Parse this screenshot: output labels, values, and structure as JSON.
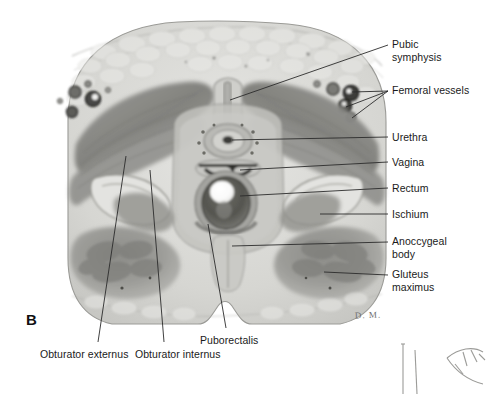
{
  "figure": {
    "panel_letter": "B",
    "artist_signature": "D. M."
  },
  "labels_right": [
    {
      "name": "pubic-symphysis",
      "lines": [
        "Pubic",
        "symphysis"
      ],
      "x": 392,
      "y": 38
    },
    {
      "name": "femoral-vessels",
      "lines": [
        "Femoral vessels"
      ],
      "x": 392,
      "y": 89
    },
    {
      "name": "urethra",
      "lines": [
        "Urethra"
      ],
      "x": 392,
      "y": 131
    },
    {
      "name": "vagina",
      "lines": [
        "Vagina"
      ],
      "x": 392,
      "y": 156
    },
    {
      "name": "rectum",
      "lines": [
        "Rectum"
      ],
      "x": 392,
      "y": 182
    },
    {
      "name": "ischium",
      "lines": [
        "Ischium"
      ],
      "x": 392,
      "y": 208
    },
    {
      "name": "anococcygeal-body",
      "lines": [
        "Anoccygeal",
        "body"
      ],
      "x": 392,
      "y": 235
    },
    {
      "name": "gluteus-maximus",
      "lines": [
        "Gluteus",
        "maximus"
      ],
      "x": 392,
      "y": 268
    }
  ],
  "labels_bottom": [
    {
      "name": "obturator-externus",
      "lines": [
        "Obturator externus"
      ],
      "x": 40,
      "y": 348
    },
    {
      "name": "obturator-internus",
      "lines": [
        "Obturator internus"
      ],
      "x": 135,
      "y": 348
    },
    {
      "name": "puborectalis",
      "lines": [
        "Puborectalis"
      ],
      "x": 200,
      "y": 334
    }
  ],
  "colors": {
    "background": "#ffffff",
    "leader_line": "#2b2b2b",
    "text": "#1a1a1a",
    "tissue_light": "#d9d9d6",
    "tissue_mid": "#b4b4b0",
    "muscle_dark": "#8a8a86",
    "muscle_darker": "#6e6e6a",
    "lumen_white": "#fdfdfd",
    "vessel_dark": "#3a3a38"
  }
}
